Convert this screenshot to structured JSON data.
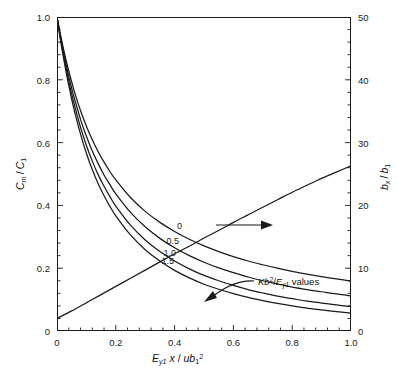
{
  "chart_data": {
    "type": "line",
    "title": "",
    "xlabel": "E_y1 x / u b_1^2",
    "ylabel_left": "C_m / C_1",
    "ylabel_right": "b_x / b_1",
    "xlim": [
      0,
      1.0
    ],
    "ylim_left": [
      0,
      1.0
    ],
    "ylim_right": [
      0,
      50
    ],
    "grid": false,
    "legend_position": "inline-curve-labels",
    "x_ticks": [
      "0",
      "0.2",
      "0.4",
      "0.6",
      "0.8",
      "1.0"
    ],
    "x_tick_values": [
      0,
      0.2,
      0.4,
      0.6,
      0.8,
      1.0
    ],
    "x_minor_count": 4,
    "y_left_ticks": [
      "0",
      "0.2",
      "0.4",
      "0.6",
      "0.8",
      "1.0"
    ],
    "y_left_tick_values": [
      0,
      0.2,
      0.4,
      0.6,
      0.8,
      1.0
    ],
    "y_left_minor_count": 4,
    "y_right_ticks": [
      "0",
      "10",
      "20",
      "30",
      "40",
      "50"
    ],
    "y_right_tick_values": [
      0,
      10,
      20,
      30,
      40,
      50
    ],
    "y_right_minor_count": 4,
    "annotation": "Kb2/Ey1 values",
    "annotation_parts": {
      "pre": "K",
      "base": "b",
      "exp": "2",
      "slash": "/",
      "e": "E",
      "esub": "y1",
      "post": " values"
    },
    "series": [
      {
        "name": "0",
        "label": "0",
        "axis": "left",
        "kb2": 0,
        "x": [
          0,
          0.01,
          0.02,
          0.03,
          0.04,
          0.05,
          0.06,
          0.08,
          0.1,
          0.12,
          0.14,
          0.16,
          0.18,
          0.2,
          0.25,
          0.3,
          0.35,
          0.4,
          0.45,
          0.5,
          0.55,
          0.6,
          0.65,
          0.7,
          0.75,
          0.8,
          0.85,
          0.9,
          0.95,
          1.0
        ],
        "y": [
          1.0,
          0.952,
          0.907,
          0.866,
          0.828,
          0.793,
          0.76,
          0.702,
          0.652,
          0.609,
          0.571,
          0.538,
          0.508,
          0.481,
          0.425,
          0.381,
          0.346,
          0.317,
          0.292,
          0.271,
          0.253,
          0.237,
          0.223,
          0.211,
          0.2,
          0.19,
          0.181,
          0.173,
          0.166,
          0.159
        ]
      },
      {
        "name": "0.5",
        "label": "0.5",
        "axis": "left",
        "kb2": 0.5,
        "x": [
          0,
          0.01,
          0.02,
          0.03,
          0.04,
          0.05,
          0.06,
          0.08,
          0.1,
          0.12,
          0.14,
          0.16,
          0.18,
          0.2,
          0.25,
          0.3,
          0.35,
          0.4,
          0.45,
          0.5,
          0.55,
          0.6,
          0.65,
          0.7,
          0.75,
          0.8,
          0.85,
          0.9,
          0.95,
          1.0
        ],
        "y": [
          1.0,
          0.947,
          0.898,
          0.853,
          0.811,
          0.773,
          0.738,
          0.674,
          0.62,
          0.573,
          0.533,
          0.497,
          0.466,
          0.437,
          0.378,
          0.332,
          0.295,
          0.265,
          0.24,
          0.219,
          0.201,
          0.186,
          0.172,
          0.16,
          0.15,
          0.14,
          0.132,
          0.125,
          0.118,
          0.112
        ]
      },
      {
        "name": "1.0",
        "label": "1.0",
        "axis": "left",
        "kb2": 1.0,
        "x": [
          0,
          0.01,
          0.02,
          0.03,
          0.04,
          0.05,
          0.06,
          0.08,
          0.1,
          0.12,
          0.14,
          0.16,
          0.18,
          0.2,
          0.25,
          0.3,
          0.35,
          0.4,
          0.45,
          0.5,
          0.55,
          0.6,
          0.65,
          0.7,
          0.75,
          0.8,
          0.85,
          0.9,
          0.95,
          1.0
        ],
        "y": [
          1.0,
          0.942,
          0.89,
          0.841,
          0.796,
          0.755,
          0.717,
          0.649,
          0.591,
          0.541,
          0.498,
          0.461,
          0.428,
          0.398,
          0.337,
          0.29,
          0.253,
          0.223,
          0.198,
          0.177,
          0.16,
          0.145,
          0.132,
          0.121,
          0.111,
          0.103,
          0.095,
          0.089,
          0.083,
          0.078
        ]
      },
      {
        "name": "1.5",
        "label": "1.5",
        "axis": "left",
        "kb2": 1.5,
        "x": [
          0,
          0.01,
          0.02,
          0.03,
          0.04,
          0.05,
          0.06,
          0.08,
          0.1,
          0.12,
          0.14,
          0.16,
          0.18,
          0.2,
          0.25,
          0.3,
          0.35,
          0.4,
          0.45,
          0.5,
          0.55,
          0.6,
          0.65,
          0.7,
          0.75,
          0.8,
          0.85,
          0.9,
          0.95,
          1.0
        ],
        "y": [
          1.0,
          0.937,
          0.881,
          0.829,
          0.782,
          0.738,
          0.698,
          0.627,
          0.566,
          0.514,
          0.469,
          0.431,
          0.397,
          0.367,
          0.306,
          0.259,
          0.223,
          0.193,
          0.169,
          0.149,
          0.133,
          0.119,
          0.107,
          0.097,
          0.088,
          0.08,
          0.073,
          0.067,
          0.062,
          0.057
        ]
      },
      {
        "name": "bx/b1",
        "label": "",
        "axis": "right",
        "x": [
          0,
          0.05,
          0.1,
          0.15,
          0.2,
          0.25,
          0.3,
          0.35,
          0.4,
          0.45,
          0.5,
          0.55,
          0.6,
          0.65,
          0.7,
          0.75,
          0.8,
          0.85,
          0.9,
          0.95,
          1.0
        ],
        "y": [
          2.0,
          3.2,
          4.5,
          5.8,
          7.1,
          8.4,
          9.7,
          11.0,
          12.3,
          13.5,
          14.8,
          16.0,
          17.3,
          18.5,
          19.7,
          20.9,
          22.1,
          23.2,
          24.3,
          25.3,
          26.3
        ]
      }
    ]
  },
  "axes": {
    "x_title_parts": {
      "e": "E",
      "esub": "y1",
      "x": "x",
      "slash": "/",
      "u": "u",
      "b": "b",
      "bsub": "1",
      "bsup": "2"
    },
    "y_left_title_parts": {
      "c": "C",
      "csub": "m",
      "slash": "/",
      "c2": "C",
      "c2sub": "1"
    },
    "y_right_title_parts": {
      "b": "b",
      "bsub": "x",
      "slash": "/",
      "b2": "b",
      "b2sub": "1"
    }
  },
  "colors": {
    "line": "#1a1a1a",
    "frame": "#1a1a1a",
    "background": "#ffffff"
  }
}
